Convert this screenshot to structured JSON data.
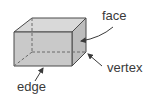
{
  "diagram": {
    "labels": {
      "face": "face",
      "vertex": "vertex",
      "edge": "edge"
    },
    "colors": {
      "front_face": "#c9c9c9",
      "top_face": "#d9d9d9",
      "side_face": "#bdbdbd",
      "stroke": "#4a4a4a",
      "hidden_edge": "#6a6a6a",
      "arrow": "#3a3a3a",
      "label_text": "#3a3a3a"
    }
  }
}
